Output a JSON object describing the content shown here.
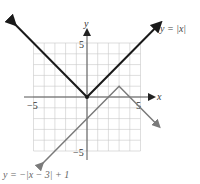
{
  "chart_data": {
    "type": "line",
    "title": "",
    "xlabel": "x",
    "ylabel": "y",
    "xlim": [
      -5,
      5
    ],
    "ylim": [
      -5,
      5
    ],
    "grid": true,
    "ticks": {
      "x": [
        "-5",
        "5"
      ],
      "y": [
        "5",
        "-5"
      ]
    },
    "series": [
      {
        "name": "y = |x|",
        "color": "#1a1a1a",
        "points": [
          [
            -6.8,
            6.8
          ],
          [
            0,
            0
          ],
          [
            6.8,
            6.8
          ]
        ]
      },
      {
        "name": "y = -|x − 3| + 1",
        "color": "#7a7a7a",
        "points": [
          [
            -4.2,
            -6.2
          ],
          [
            3,
            1
          ],
          [
            6.7,
            -2.7
          ]
        ]
      }
    ],
    "annotations": [
      {
        "text": "y = |x|",
        "near": "upper-right arm of V"
      },
      {
        "text": "y = −|x − 3| + 1",
        "near": "bottom-left"
      }
    ]
  },
  "labels": {
    "x_axis": "x",
    "y_axis": "y",
    "x_tick_neg": "−5",
    "x_tick_pos": "5",
    "y_tick_pos": "5",
    "y_tick_neg": "−5",
    "eq1": "y = |x|",
    "eq2": "y = −|x − 3| + 1"
  }
}
